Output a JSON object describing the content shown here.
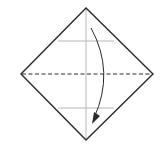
{
  "diagram": {
    "type": "origami-fold-step",
    "background": "#ffffff",
    "outline_color": "#2a2a2a",
    "crease_color": "#b8b8b8",
    "square": {
      "orientation": "diamond",
      "vertices": {
        "top": [
          86,
          8
        ],
        "right": [
          153,
          74
        ],
        "bottom": [
          86,
          140
        ],
        "left": [
          21,
          74
        ]
      }
    },
    "valley_fold_line": {
      "style": "dashed",
      "y": 74,
      "x1": 21,
      "x2": 153
    },
    "creases": [
      {
        "orientation": "vertical",
        "x": 86,
        "y1": 8,
        "y2": 140
      },
      {
        "orientation": "horizontal",
        "y": 41,
        "x1": 58,
        "x2": 114
      },
      {
        "orientation": "horizontal",
        "y": 108,
        "x1": 58,
        "x2": 114
      }
    ],
    "arrow": {
      "direction": "fold-top-down",
      "from": [
        91,
        28
      ],
      "to": [
        93,
        123
      ]
    }
  }
}
